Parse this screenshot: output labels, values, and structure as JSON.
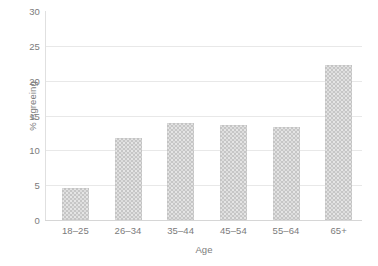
{
  "chart_data": {
    "type": "bar",
    "title": "",
    "subtitle": "",
    "xlabel": "Age",
    "ylabel": "% Agreeing",
    "categories": [
      "18–25",
      "26–34",
      "35–44",
      "45–54",
      "55–64",
      "65+"
    ],
    "values": [
      4.6,
      11.8,
      13.9,
      13.7,
      13.4,
      22.2
    ],
    "series": [
      {
        "name": "% Agreeing",
        "values": [
          4.6,
          11.8,
          13.9,
          13.7,
          13.4,
          22.2
        ]
      }
    ],
    "ylim": [
      0,
      30
    ],
    "yticks": [
      0,
      5,
      10,
      15,
      20,
      25,
      30
    ],
    "ytick_labels": [
      "0",
      "5",
      "10",
      "15",
      "20",
      "25",
      "30"
    ],
    "grid": true,
    "grid_axis": "y",
    "legend": false,
    "legend_position": "none",
    "bar_color": "#c6c6c6",
    "grid_color": "#e8e8e8",
    "text_color": "#7b7b7b",
    "background_color": "#ffffff",
    "annotations": []
  }
}
